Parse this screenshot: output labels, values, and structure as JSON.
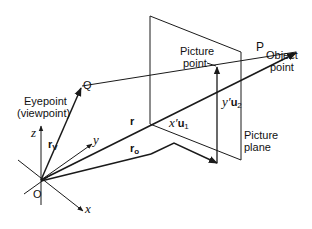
{
  "diagram": {
    "labels": {
      "eyepoint_line1": "Eyepoint",
      "eyepoint_line2": "(viewpoint)",
      "Q": "Q",
      "O": "O",
      "P": "P",
      "object_line1": "Object",
      "object_line2": "point",
      "picture_point_line1": "Picture",
      "picture_point_line2": "point",
      "picture_plane_line1": "Picture",
      "picture_plane_line2": "plane",
      "x_axis": "x",
      "y_axis": "y",
      "z_axis": "z",
      "r": "r",
      "r_v": "r",
      "r_v_sub": "V",
      "r_o": "r",
      "r_o_sub": "o",
      "xu1_prefix": "x′",
      "xu1_vec": "u",
      "xu1_sub": "1",
      "yu2_prefix": "y′",
      "yu2_vec": "u",
      "yu2_sub": "2"
    },
    "points": {
      "O": [
        41,
        180
      ],
      "Q": [
        82,
        86
      ],
      "P": [
        297,
        52
      ],
      "picture_point": [
        218,
        66
      ],
      "plane_corners": [
        [
          150,
          16
        ],
        [
          241,
          52
        ],
        [
          241,
          160
        ],
        [
          150,
          124
        ]
      ]
    },
    "colors": {
      "line": "#1a1a1a",
      "background": "#ffffff"
    }
  }
}
